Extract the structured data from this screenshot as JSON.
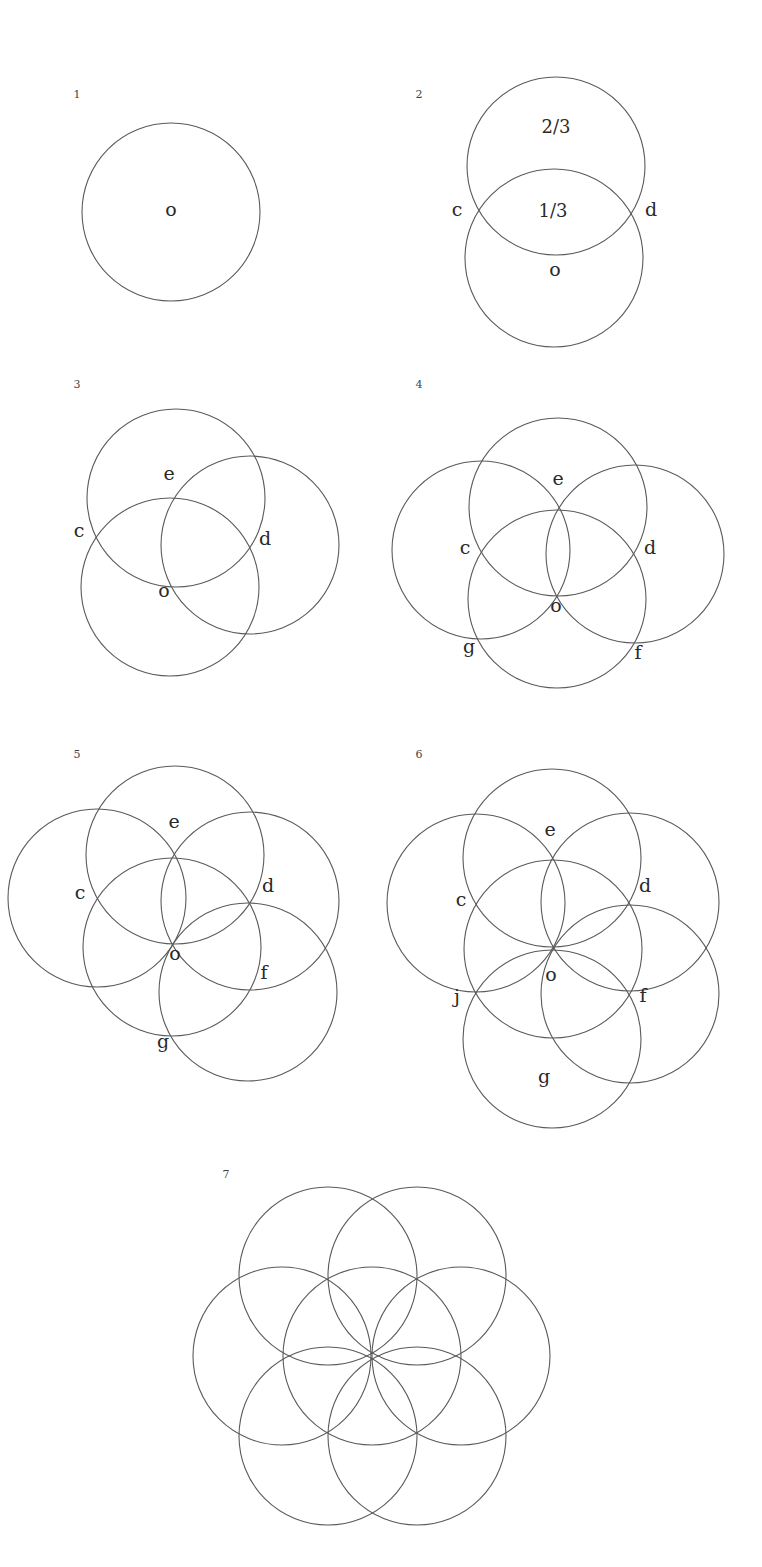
{
  "figure": {
    "stroke_color": "#5a5a5a",
    "label_color": "#2a2a2a",
    "background": "#ffffff",
    "circle_radius": 89,
    "panels": [
      {
        "number": "1",
        "number_pos": [
          77,
          98
        ],
        "circles": [
          [
            171,
            212
          ]
        ],
        "labels": [
          {
            "text": "o",
            "x": 171,
            "y": 216
          }
        ]
      },
      {
        "number": "2",
        "number_pos": [
          419,
          98
        ],
        "circles": [
          [
            556,
            166
          ],
          [
            554,
            258
          ]
        ],
        "labels": [
          {
            "text": "2/3",
            "x": 556,
            "y": 133,
            "cls": "frac"
          },
          {
            "text": "1/3",
            "x": 553,
            "y": 217,
            "cls": "frac"
          },
          {
            "text": "c",
            "x": 457,
            "y": 216
          },
          {
            "text": "d",
            "x": 651,
            "y": 216
          },
          {
            "text": "o",
            "x": 555,
            "y": 276
          }
        ]
      },
      {
        "number": "3",
        "number_pos": [
          77,
          388
        ],
        "circles": [
          [
            176,
            498
          ],
          [
            250,
            545
          ],
          [
            170,
            587
          ]
        ],
        "labels": [
          {
            "text": "e",
            "x": 169,
            "y": 480
          },
          {
            "text": "c",
            "x": 79,
            "y": 537
          },
          {
            "text": "d",
            "x": 265,
            "y": 545
          },
          {
            "text": "o",
            "x": 164,
            "y": 597
          }
        ]
      },
      {
        "number": "4",
        "number_pos": [
          419,
          388
        ],
        "circles": [
          [
            558,
            507
          ],
          [
            481,
            550
          ],
          [
            635,
            554
          ],
          [
            557,
            599
          ]
        ],
        "labels": [
          {
            "text": "e",
            "x": 558,
            "y": 485
          },
          {
            "text": "c",
            "x": 465,
            "y": 554
          },
          {
            "text": "d",
            "x": 650,
            "y": 554
          },
          {
            "text": "o",
            "x": 556,
            "y": 612
          },
          {
            "text": "g",
            "x": 469,
            "y": 653
          },
          {
            "text": "f",
            "x": 638,
            "y": 659
          }
        ]
      },
      {
        "number": "5",
        "number_pos": [
          77,
          758
        ],
        "circles": [
          [
            175,
            855
          ],
          [
            97,
            898
          ],
          [
            250,
            901
          ],
          [
            172,
            947
          ],
          [
            248,
            992
          ]
        ],
        "labels": [
          {
            "text": "e",
            "x": 174,
            "y": 828
          },
          {
            "text": "c",
            "x": 80,
            "y": 899
          },
          {
            "text": "d",
            "x": 268,
            "y": 892
          },
          {
            "text": "o",
            "x": 175,
            "y": 960
          },
          {
            "text": "f",
            "x": 264,
            "y": 979
          },
          {
            "text": "g",
            "x": 163,
            "y": 1048
          }
        ]
      },
      {
        "number": "6",
        "number_pos": [
          419,
          758
        ],
        "circles": [
          [
            552,
            858
          ],
          [
            476,
            903
          ],
          [
            630,
            902
          ],
          [
            553,
            949
          ],
          [
            630,
            994
          ],
          [
            552,
            1039
          ]
        ],
        "labels": [
          {
            "text": "e",
            "x": 550,
            "y": 836
          },
          {
            "text": "c",
            "x": 461,
            "y": 906
          },
          {
            "text": "d",
            "x": 645,
            "y": 892
          },
          {
            "text": "o",
            "x": 551,
            "y": 981
          },
          {
            "text": "j",
            "x": 457,
            "y": 1003
          },
          {
            "text": "f",
            "x": 643,
            "y": 1002
          },
          {
            "text": "g",
            "x": 544,
            "y": 1083
          }
        ]
      },
      {
        "number": "7",
        "number_pos": [
          226,
          1178
        ],
        "circles": [
          [
            372,
            1356
          ],
          [
            328,
            1276
          ],
          [
            417,
            1276
          ],
          [
            282,
            1356
          ],
          [
            461,
            1356
          ],
          [
            328,
            1436
          ],
          [
            417,
            1436
          ]
        ],
        "labels": []
      }
    ]
  }
}
